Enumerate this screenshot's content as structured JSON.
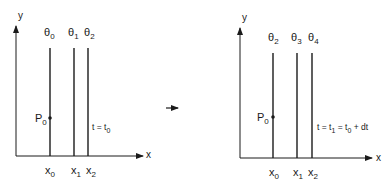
{
  "left_panel": {
    "y_axis_label": "y",
    "x_axis_label": "x",
    "lines": [
      {
        "theta": "θ",
        "theta_sub": "0",
        "x_label": "x",
        "x_sub": "0"
      },
      {
        "theta": "θ",
        "theta_sub": "1",
        "x_label": "x",
        "x_sub": "1"
      },
      {
        "theta": "θ",
        "theta_sub": "2",
        "x_label": "x",
        "x_sub": "2"
      }
    ],
    "point": {
      "label": "P",
      "sub": "0"
    },
    "time_label": {
      "t": "t = t",
      "sub": "0"
    }
  },
  "transition_arrow": "→",
  "right_panel": {
    "y_axis_label": "y",
    "x_axis_label": "x",
    "lines": [
      {
        "theta": "θ",
        "theta_sub": "2",
        "x_label": "x",
        "x_sub": "0"
      },
      {
        "theta": "θ",
        "theta_sub": "3",
        "x_label": "x",
        "x_sub": "1"
      },
      {
        "theta": "θ",
        "theta_sub": "4",
        "x_label": "x",
        "x_sub": "2"
      }
    ],
    "point": {
      "label": "P",
      "sub": "0"
    },
    "time_label": {
      "a": "t = t",
      "a_sub": "1",
      "b": " = t",
      "b_sub": "0",
      "c": " + dt"
    }
  }
}
